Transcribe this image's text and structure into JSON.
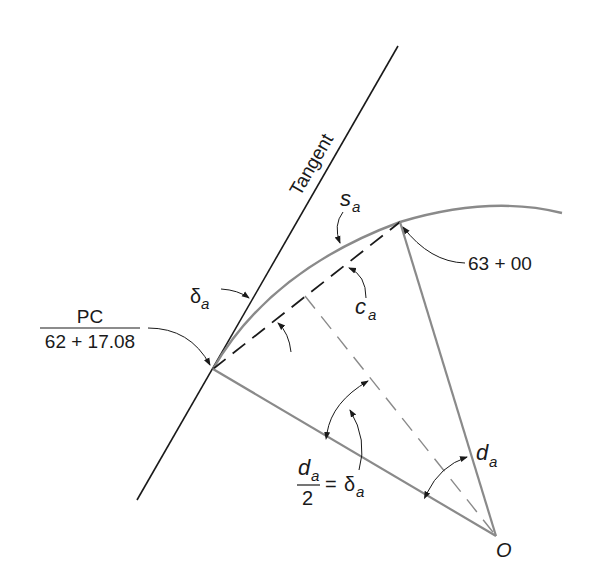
{
  "diagram": {
    "colors": {
      "background": "#ffffff",
      "tangent": "#1a1a1a",
      "curve": "#8a8a8a",
      "radius": "#8a8a8a",
      "chord": "#1a1a1a",
      "dashed_perpendicular": "#8a8a8a",
      "text": "#1a1a1a",
      "arrows": "#1a1a1a"
    },
    "labels": {
      "tangent": "Tangent",
      "arc_length_main": "s",
      "arc_length_sub": "a",
      "chord_main": "c",
      "chord_sub": "a",
      "deflection_main": "δ",
      "deflection_sub": "a",
      "station_end": "63 + 00",
      "pc_top": "PC",
      "pc_bottom": "62 + 17.08",
      "central_angle_main": "d",
      "central_angle_sub": "a",
      "half_angle_num_main": "d",
      "half_angle_num_sub": "a",
      "half_angle_den": "2",
      "half_angle_eq": "=",
      "half_angle_rhs_main": "δ",
      "half_angle_rhs_sub": "a",
      "center": "O"
    },
    "points": {
      "pc": [
        213,
        369
      ],
      "station_63": [
        400,
        222
      ],
      "center_o": [
        496,
        536
      ],
      "chord_mid": [
        305,
        296
      ],
      "tangent_top": [
        398,
        46
      ],
      "tangent_bottom": [
        137,
        500
      ],
      "curve_end": [
        562,
        213
      ]
    }
  }
}
